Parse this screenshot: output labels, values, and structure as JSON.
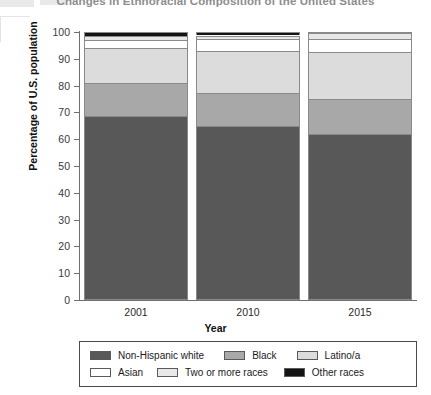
{
  "chart_data": {
    "type": "bar",
    "subtype": "stacked-bar-100-percent",
    "title": "Changes in Ethnoracial Composition of the United States",
    "xlabel": "Year",
    "ylabel": "Percentage of U.S. population",
    "ylim": [
      0,
      100
    ],
    "ytick_step": 10,
    "yticks": [
      100,
      90,
      80,
      70,
      60,
      50,
      40,
      30,
      20,
      10,
      0
    ],
    "grid": false,
    "legend_position": "bottom",
    "categories": [
      "2001",
      "2010",
      "2015"
    ],
    "series": [
      {
        "name": "Non-Hispanic white",
        "color": "#585858",
        "values": [
          68.5,
          64.8,
          62.0
        ]
      },
      {
        "name": "Black",
        "color": "#a8a8a8",
        "values": [
          12.5,
          12.4,
          13.0
        ]
      },
      {
        "name": "Latino/a",
        "color": "#dcdcdc",
        "values": [
          13.0,
          15.8,
          17.5
        ]
      },
      {
        "name": "Asian",
        "color": "#ffffff",
        "values": [
          3.0,
          4.3,
          5.0
        ]
      },
      {
        "name": "Two or more races",
        "color": "#e8e8e8",
        "values": [
          1.5,
          1.4,
          2.0
        ]
      },
      {
        "name": "Other races",
        "color": "#141414",
        "values": [
          1.5,
          1.3,
          0.5
        ]
      }
    ]
  },
  "axes": {
    "y_title": "Percentage of U.S. population",
    "x_title": "Year",
    "y_ticks": [
      "100",
      "90",
      "80",
      "70",
      "60",
      "50",
      "40",
      "30",
      "20",
      "10",
      "0"
    ],
    "x_ticks": [
      "2001",
      "2010",
      "2015"
    ]
  },
  "legend": {
    "row1": [
      {
        "label": "Non-Hispanic white",
        "color": "#585858"
      },
      {
        "label": "Black",
        "color": "#a8a8a8"
      },
      {
        "label": "Latino/a",
        "color": "#dcdcdc"
      }
    ],
    "row2": [
      {
        "label": "Asian",
        "color": "#ffffff"
      },
      {
        "label": "Two or more races",
        "color": "#e8e8e8"
      },
      {
        "label": "Other races",
        "color": "#141414"
      }
    ]
  }
}
